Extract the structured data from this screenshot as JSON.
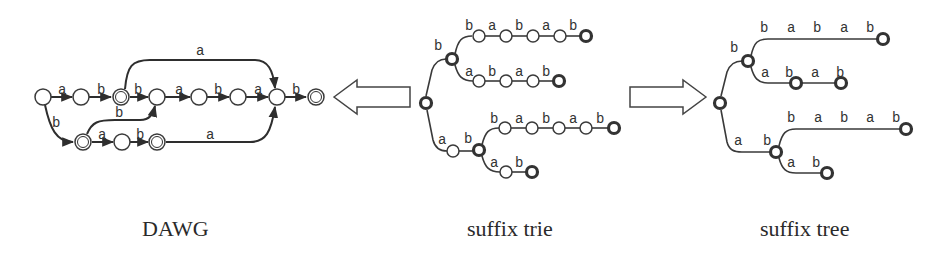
{
  "captions": {
    "dawg": "DAWG",
    "trie": "suffix trie",
    "tree": "suffix tree"
  },
  "arrows": [
    {
      "name": "trie-to-dawg-arrow",
      "direction": "left"
    },
    {
      "name": "trie-to-tree-arrow",
      "direction": "right"
    }
  ],
  "dawg": {
    "edge_labels": {
      "top_arc": "a",
      "e1": "a",
      "e2": "b",
      "e3": "b",
      "e4": "a",
      "e5": "b",
      "e6": "a",
      "e7": "b",
      "down": "b",
      "cross": "b",
      "low1": "a",
      "low2": "b",
      "low_arc": "a"
    }
  },
  "trie": {
    "labels": {
      "root_b": "b",
      "r1": [
        "b",
        "a",
        "b",
        "a",
        "b"
      ],
      "r2": [
        "a",
        "b",
        "a",
        "b"
      ],
      "root_a": "a",
      "ab_b": "b",
      "r3": [
        "b",
        "a",
        "b",
        "a",
        "b"
      ],
      "r4": [
        "a",
        "b"
      ]
    }
  },
  "tree": {
    "labels": {
      "root_b": "b",
      "r1": [
        "b",
        "a",
        "b",
        "a",
        "b"
      ],
      "r2": [
        "a",
        "b",
        "a",
        "b"
      ],
      "root_a": "a",
      "ab_b": "b",
      "r3": [
        "b",
        "a",
        "b",
        "a",
        "b"
      ],
      "r4": [
        "a",
        "b"
      ]
    }
  }
}
